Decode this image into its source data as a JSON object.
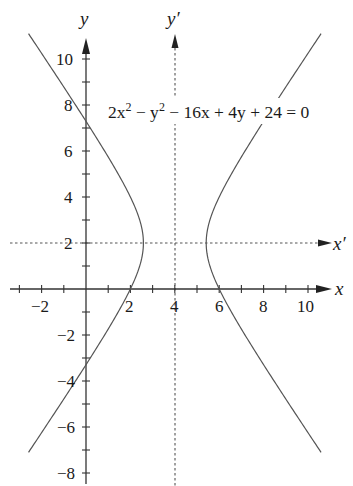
{
  "diagram": {
    "type": "conic-section-graph",
    "equation": {
      "text_parts": [
        "2x",
        "2",
        " − y",
        "2",
        " − 16x + 4y + 24 = 0"
      ],
      "display": "2x² − y² − 16x + 4y + 24 = 0"
    },
    "axes": {
      "x_label": "x",
      "y_label": "y",
      "x_prime_label": "x′",
      "y_prime_label": "y′",
      "x_tick_labels": [
        "−2",
        "2",
        "4",
        "6",
        "8",
        "10"
      ],
      "y_tick_labels": [
        "10",
        "8",
        "6",
        "4",
        "2",
        "−2",
        "−4",
        "−6",
        "−8"
      ],
      "x_range": [
        -3.4,
        10.9
      ],
      "y_range": [
        -8.5,
        11.3
      ],
      "translated_origin": {
        "x": 4,
        "y": 2
      }
    },
    "curve": {
      "kind": "hyperbola",
      "center": [
        4,
        2
      ],
      "standard_form": "(x−4)²/2 − (y−2)²/4 = 1",
      "vertices": [
        [
          2.59,
          2
        ],
        [
          5.41,
          2
        ]
      ],
      "y_extent": [
        -7.1,
        11.1
      ]
    },
    "colors": {
      "axis": "#333333",
      "curve": "#555555",
      "dashed": "#555555",
      "background": "#ffffff"
    }
  }
}
